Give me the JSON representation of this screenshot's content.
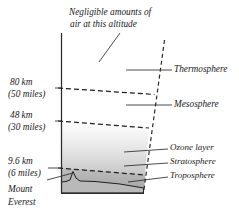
{
  "figure": {
    "annotation": {
      "line1": "Negligible amounts of",
      "line2": "air at this altitude"
    },
    "altitude_labels": [
      {
        "km": "80 km",
        "miles": "(50 miles)"
      },
      {
        "km": "48 km",
        "miles": "(30 miles)"
      },
      {
        "km": "9.6 km",
        "miles": "(6 miles)"
      }
    ],
    "landmark": {
      "line1": "Mount",
      "line2": "Everest"
    },
    "layer_labels": [
      {
        "name": "Thermosphere"
      },
      {
        "name": "Mesosphere"
      },
      {
        "name": "Ozone layer"
      },
      {
        "name": "Stratosphere"
      },
      {
        "name": "Troposphere"
      }
    ],
    "colors": {
      "background": "#ffffff",
      "ink": "#1f1f1f",
      "axis": "#2b2b2b",
      "shade_top": "#f2f2f2",
      "shade_mid": "#d8d8d8",
      "shade_bottom": "#a9a9a9",
      "mountain_fill": "#b9b9b9"
    }
  }
}
